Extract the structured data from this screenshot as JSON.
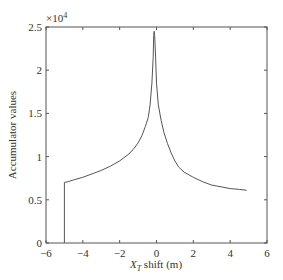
{
  "chart_data": {
    "type": "line",
    "title": "",
    "xlabel": "X_T shift (m)",
    "xlabel_main": "X",
    "xlabel_sub": "T",
    "xlabel_rest": " shift (m)",
    "ylabel": "Accumulator values",
    "y_multiplier": "×10",
    "y_multiplier_exp": "4",
    "xlim": [
      -6,
      6
    ],
    "ylim": [
      0,
      2.5
    ],
    "xticks": [
      -6,
      -4,
      -2,
      0,
      2,
      4,
      6
    ],
    "xtick_labels": [
      "−6",
      "−4",
      "−2",
      "0",
      "2",
      "4",
      "6"
    ],
    "yticks": [
      0,
      0.5,
      1,
      1.5,
      2,
      2.5
    ],
    "ytick_labels": [
      "0",
      "0.5",
      "1",
      "1.5",
      "2",
      "2.5"
    ],
    "grid": false,
    "legend": null,
    "series": [
      {
        "name": "Accumulator",
        "color": "#555555",
        "x": [
          -5.0,
          -5.0,
          -4.8,
          -4.5,
          -4.0,
          -3.5,
          -3.0,
          -2.5,
          -2.0,
          -1.5,
          -1.2,
          -1.0,
          -0.8,
          -0.6,
          -0.45,
          -0.35,
          -0.25,
          -0.18,
          -0.15,
          -0.13,
          -0.1,
          -0.05,
          0.0,
          0.1,
          0.25,
          0.4,
          0.6,
          0.8,
          1.0,
          1.2,
          1.5,
          2.0,
          2.5,
          3.0,
          3.5,
          4.0,
          4.5,
          4.9
        ],
        "y": [
          0.0,
          0.7,
          0.71,
          0.73,
          0.76,
          0.8,
          0.84,
          0.89,
          0.95,
          1.03,
          1.1,
          1.16,
          1.24,
          1.35,
          1.45,
          1.6,
          1.85,
          2.15,
          2.4,
          2.45,
          2.4,
          2.15,
          1.85,
          1.6,
          1.42,
          1.28,
          1.15,
          1.04,
          0.95,
          0.88,
          0.82,
          0.76,
          0.71,
          0.67,
          0.65,
          0.63,
          0.62,
          0.61
        ]
      }
    ]
  }
}
